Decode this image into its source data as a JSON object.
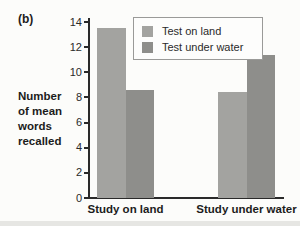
{
  "figure": {
    "panel_label": "(b)",
    "ylabel_lines": [
      "Number",
      "of mean",
      "words",
      "recalled"
    ]
  },
  "chart_data": {
    "type": "bar",
    "title": "",
    "xlabel": "",
    "ylabel": "Number of mean words recalled",
    "categories": [
      "Study on land",
      "Study under water"
    ],
    "series": [
      {
        "name": "Test on land",
        "values": [
          13.5,
          8.4
        ],
        "color": "#a3a3a0"
      },
      {
        "name": "Test under water",
        "values": [
          8.6,
          11.4
        ],
        "color": "#8e8e8b"
      }
    ],
    "ylim": [
      0,
      14
    ],
    "yticks": [
      0,
      2,
      4,
      6,
      8,
      10,
      12,
      14
    ],
    "grid": false,
    "legend_position": "top-center"
  }
}
